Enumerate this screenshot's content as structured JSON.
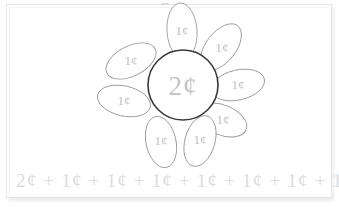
{
  "worksheet": {
    "title": "Coin value flower",
    "center": {
      "value": "2¢",
      "shape": "circle"
    },
    "petals": [
      {
        "id": "petal-top",
        "value": "1¢",
        "angle_deg": -90,
        "cx": 182,
        "cy": 31
      },
      {
        "id": "petal-upper-right",
        "value": "1¢",
        "angle_deg": -45,
        "cx": 221,
        "cy": 47
      },
      {
        "id": "petal-right",
        "value": "1¢",
        "angle_deg": 0,
        "cx": 238,
        "cy": 85
      },
      {
        "id": "petal-lower-right",
        "value": "1¢",
        "angle_deg": 45,
        "cx": 222,
        "cy": 122
      },
      {
        "id": "petal-bottom-right",
        "value": "1¢",
        "angle_deg": 80,
        "cx": 199,
        "cy": 140
      },
      {
        "id": "petal-bottom-left",
        "value": "1¢",
        "angle_deg": 100,
        "cx": 161,
        "cy": 141
      },
      {
        "id": "petal-left",
        "value": "1¢",
        "angle_deg": 180,
        "cx": 124,
        "cy": 101
      },
      {
        "id": "petal-upper-left",
        "value": "1¢",
        "angle_deg": 215,
        "cx": 131,
        "cy": 61
      }
    ],
    "equation": {
      "text": "2¢ + 1¢ + 1¢ + 1¢ + 1¢ + 1¢ + 1¢ + 1¢ + 1¢ = 10¢",
      "terms": [
        "2¢",
        "1¢",
        "1¢",
        "1¢",
        "1¢",
        "1¢",
        "1¢",
        "1¢",
        "1¢"
      ],
      "total": "10¢"
    },
    "colors": {
      "page_background": "#ffffff",
      "page_border": "#e6e6e6",
      "center_outline": "#3a3a3a",
      "petal_outline": "#9a9a9a",
      "petal_text": "#c2c2c2",
      "center_text": "#c4c4c4",
      "equation_text": "#dcdcdc"
    }
  }
}
